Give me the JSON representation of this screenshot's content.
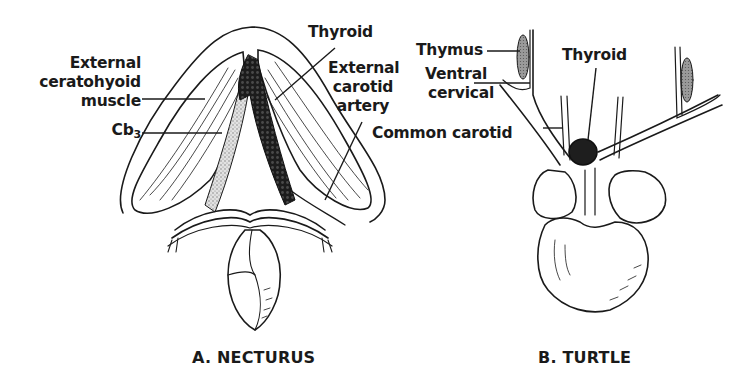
{
  "figure": {
    "panels": [
      {
        "id": "A",
        "caption": "A. NECTURUS",
        "labels": {
          "ext_ceratohyoid_1": "External",
          "ext_ceratohyoid_2": "ceratohyoid",
          "ext_ceratohyoid_3": "muscle",
          "cb_base": "Cb",
          "cb_sub": "3",
          "thyroid": "Thyroid",
          "ext_carotid_1": "External",
          "ext_carotid_2": "carotid",
          "ext_carotid_3": "artery"
        }
      },
      {
        "id": "B",
        "caption": "B. TURTLE",
        "labels": {
          "thymus": "Thymus",
          "thyroid": "Thyroid",
          "ventral_cervical_1": "Ventral",
          "ventral_cervical_2": "cervical",
          "common_carotid": "Common carotid"
        }
      }
    ],
    "colors": {
      "ink": "#1a1a1a",
      "background": "#ffffff",
      "stipple": "#9a9a9a",
      "thyroid_dark": "#222222"
    }
  }
}
